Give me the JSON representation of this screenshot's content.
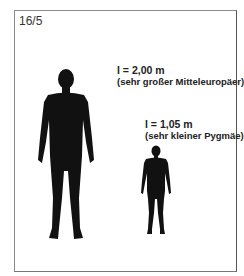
{
  "figure_number": "16/5",
  "tall_person": {
    "height_label": "l = 2,00 m",
    "description": "(sehr großer Mitteleuropäer)"
  },
  "short_person": {
    "height_label": "l = 1,05 m",
    "description": "(sehr kleiner Pygmäe)"
  },
  "colors": {
    "silhouette": "#111111",
    "frame": "#8a8a8a"
  }
}
